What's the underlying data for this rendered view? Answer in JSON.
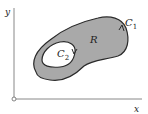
{
  "diagram": {
    "axes": {
      "x_label": "x",
      "y_label": "y"
    },
    "region_label": "R",
    "outer_curve_label": "C",
    "outer_curve_sub": "1",
    "inner_curve_label": "C",
    "inner_curve_sub": "2",
    "colors": {
      "region_fill": "#a9a9a9",
      "outline": "#2a2a2a",
      "axis": "#888888",
      "background": "#ffffff"
    }
  }
}
